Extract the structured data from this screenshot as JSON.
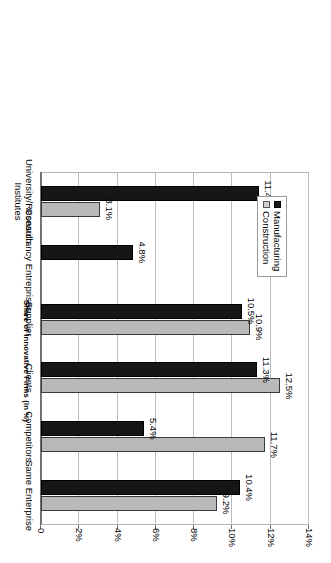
{
  "chart_data": {
    "type": "bar",
    "title": "",
    "subtitle": "",
    "orientation": "vertical-rotated-90cw",
    "xlabel": "",
    "ylabel": "Share of Innovative Firms (in %)",
    "categories": [
      "University/Research Institutes",
      "Consultancy Entreprises",
      "Supplier",
      "Clients",
      "Competitors",
      "Same Enterprise"
    ],
    "category_lines": [
      [
        "University/Research",
        "Institutes"
      ],
      [
        "Consultancy Entreprises"
      ],
      [
        "Supplier"
      ],
      [
        "Clients"
      ],
      [
        "Competitors"
      ],
      [
        "Same Enterprise"
      ]
    ],
    "series": [
      {
        "name": "Manufacturing",
        "color": "#161616",
        "values": [
          11.4,
          4.8,
          10.5,
          11.3,
          5.4,
          10.4
        ],
        "labels": [
          "11.4%",
          "4.8%",
          "10.5%",
          "11.3%",
          "5.4%",
          "10.4%"
        ]
      },
      {
        "name": "Construction",
        "color": "#b9b9b9",
        "values": [
          3.1,
          null,
          10.9,
          12.5,
          11.7,
          9.2
        ],
        "labels": [
          "3.1%",
          "",
          "10.9%",
          "12.5%",
          "11.7%",
          "9.2%"
        ]
      }
    ],
    "ylim": [
      0,
      14
    ],
    "ytick_values": [
      0,
      2,
      4,
      6,
      8,
      10,
      12,
      14
    ],
    "ytick_labels": [
      "0",
      "2%",
      "4%",
      "6%",
      "8%",
      "10%",
      "12%",
      "14%"
    ],
    "grid": true,
    "legend_position": "inside-top-left",
    "legend": [
      "Manufacturing",
      "Construction"
    ]
  }
}
